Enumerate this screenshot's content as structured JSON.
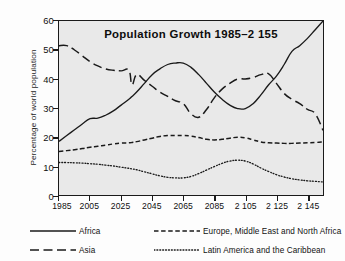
{
  "figure": {
    "title": "Population Growth  1985–2 155",
    "background_color": "#e9e9e9",
    "line_color": "#1a1a1a",
    "page_color": "#fdfdfd"
  },
  "axes": {
    "ylabel": "Percentage of world population",
    "xlabel": "",
    "y_ticklabels": [
      "0",
      "10",
      "20",
      "30",
      "40",
      "50",
      "60"
    ],
    "x_ticklabels": [
      "1985",
      "2005",
      "2025",
      "2045",
      "2065",
      "2085",
      "2 105",
      "2 125",
      "2 145"
    ]
  },
  "legend": {
    "items": [
      {
        "label": "Africa",
        "style": "solid",
        "swatch": "legend-line-solid"
      },
      {
        "label": "Europe, Middle East and North Africa",
        "style": "dashed",
        "swatch": "legend-line-dashed"
      },
      {
        "label": "Asia",
        "style": "longdash",
        "swatch": "legend-line-longdash"
      },
      {
        "label": "Latin America and the Caribbean",
        "style": "dotted",
        "swatch": "legend-line-dotted"
      }
    ]
  },
  "chart_data": {
    "type": "line",
    "title": "Population Growth  1985–2 155",
    "xlabel": "",
    "ylabel": "Percentage of world population",
    "xlim": [
      1985,
      2155
    ],
    "ylim": [
      0,
      60
    ],
    "xticks": [
      1985,
      2005,
      2025,
      2045,
      2065,
      2085,
      2105,
      2125,
      2145
    ],
    "yticks": [
      0,
      10,
      20,
      30,
      40,
      50,
      60
    ],
    "grid": false,
    "legend_position": "below",
    "x": [
      1985,
      1990,
      1995,
      2000,
      2005,
      2010,
      2015,
      2020,
      2025,
      2030,
      2032,
      2035,
      2040,
      2045,
      2050,
      2055,
      2060,
      2065,
      2070,
      2075,
      2080,
      2085,
      2090,
      2095,
      2100,
      2105,
      2110,
      2115,
      2120,
      2125,
      2130,
      2135,
      2140,
      2145,
      2150,
      2155
    ],
    "series": [
      {
        "name": "Africa",
        "style": "solid",
        "values": [
          18.5,
          20.5,
          22.5,
          24.5,
          26.3,
          26.5,
          27.5,
          29.0,
          31.0,
          33.0,
          34.0,
          35.5,
          38.5,
          41.5,
          43.5,
          45.0,
          45.5,
          45.5,
          44.0,
          41.5,
          38.5,
          35.5,
          33.0,
          31.0,
          29.8,
          29.8,
          31.5,
          34.5,
          38.0,
          41.0,
          45.0,
          49.5,
          51.5,
          54.0,
          57.0,
          60.0
        ]
      },
      {
        "name": "Europe, Middle East and North Africa",
        "style": "dashed",
        "values": [
          15.0,
          15.3,
          15.6,
          16.0,
          16.5,
          16.8,
          17.2,
          17.6,
          17.9,
          18.0,
          18.1,
          18.4,
          19.0,
          19.6,
          20.2,
          20.5,
          20.5,
          20.5,
          20.3,
          19.8,
          19.2,
          19.0,
          19.2,
          19.6,
          19.9,
          19.7,
          19.0,
          18.3,
          18.0,
          17.9,
          17.8,
          17.8,
          17.9,
          18.0,
          18.1,
          18.3
        ]
      },
      {
        "name": "Asia",
        "style": "longdash",
        "values": [
          51.5,
          51.5,
          50.0,
          48.0,
          46.0,
          44.5,
          43.5,
          43.0,
          42.8,
          43.0,
          38.0,
          41.5,
          39.5,
          37.5,
          35.5,
          34.0,
          32.5,
          31.5,
          28.0,
          26.8,
          29.5,
          33.5,
          36.5,
          38.5,
          40.0,
          40.0,
          40.5,
          41.5,
          41.8,
          38.5,
          35.0,
          33.0,
          31.5,
          29.5,
          28.0,
          22.3
        ]
      },
      {
        "name": "Latin America and the Caribbean",
        "style": "dotted",
        "values": [
          11.2,
          11.2,
          11.1,
          11.0,
          10.8,
          10.6,
          10.3,
          10.0,
          9.6,
          9.2,
          9.0,
          8.7,
          8.0,
          7.3,
          6.6,
          6.1,
          5.9,
          5.9,
          6.4,
          7.4,
          8.6,
          9.8,
          10.9,
          11.7,
          12.0,
          11.7,
          10.7,
          9.3,
          8.1,
          7.0,
          6.2,
          5.6,
          5.2,
          4.9,
          4.7,
          4.5
        ]
      }
    ]
  }
}
